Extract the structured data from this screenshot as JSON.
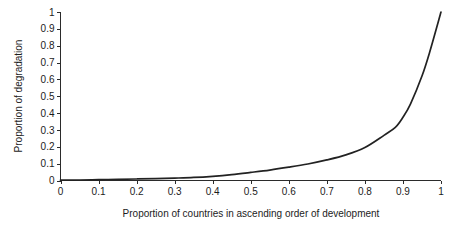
{
  "chart_data": {
    "type": "line",
    "title": "",
    "subtitle": "",
    "xlabel": "Proportion of countries in ascending order of development",
    "ylabel": "Proportion of degradation",
    "xlim": [
      0,
      1
    ],
    "ylim": [
      0,
      1
    ],
    "grid": false,
    "legend": false,
    "legend_position": "none",
    "line_color": "#222222",
    "x_ticks": [
      "0",
      "0.1",
      "0.2",
      "0.3",
      "0.4",
      "0.5",
      "0.6",
      "0.7",
      "0.8",
      "0.9",
      "1"
    ],
    "y_ticks": [
      "0",
      "0.1",
      "0.2",
      "0.3",
      "0.4",
      "0.5",
      "0.6",
      "0.7",
      "0.8",
      "0.9",
      "1"
    ],
    "x_tick_values": [
      0,
      0.1,
      0.2,
      0.3,
      0.4,
      0.5,
      0.6,
      0.7,
      0.8,
      0.9,
      1
    ],
    "y_tick_values": [
      0,
      0.1,
      0.2,
      0.3,
      0.4,
      0.5,
      0.6,
      0.7,
      0.8,
      0.9,
      1
    ],
    "series": [
      {
        "name": "Cumulative degradation",
        "x": [
          0,
          0.05,
          0.1,
          0.15,
          0.2,
          0.25,
          0.3,
          0.35,
          0.4,
          0.45,
          0.5,
          0.55,
          0.6,
          0.65,
          0.7,
          0.75,
          0.8,
          0.85,
          0.88,
          0.9,
          0.92,
          0.95,
          0.97,
          1
        ],
        "values": [
          0.002,
          0.003,
          0.005,
          0.007,
          0.009,
          0.011,
          0.014,
          0.018,
          0.025,
          0.035,
          0.048,
          0.062,
          0.079,
          0.098,
          0.122,
          0.152,
          0.196,
          0.268,
          0.315,
          0.375,
          0.455,
          0.62,
          0.76,
          1.0
        ]
      }
    ],
    "annotations": []
  },
  "axes": {
    "y_axis_title": "Proportion of degradation",
    "x_axis_title": "Proportion of countries in ascending order of development"
  }
}
